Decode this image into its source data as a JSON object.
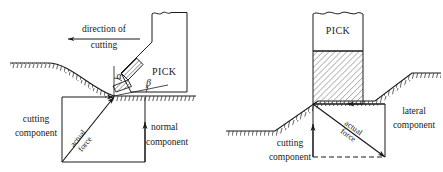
{
  "figure": {
    "stroke_color": "#1a1a1a",
    "background_color": "#ffffff",
    "hatch_color": "#6a6a6a"
  },
  "left_diagram": {
    "name": "side-view-cutting-forces",
    "direction_label_line1": "direction of",
    "direction_label_line2": "cutting",
    "pick_label": "PICK",
    "angle_alpha": "α",
    "angle_beta": "β",
    "cutting_component_line1": "cutting",
    "cutting_component_line2": "component",
    "normal_component_line1": "normal",
    "normal_component_line2": "component",
    "actual_force_line1": "actual",
    "actual_force_line2": "force"
  },
  "right_diagram": {
    "name": "front-view-cutting-forces",
    "pick_label": "PICK",
    "cutting_component_line1": "cutting",
    "cutting_component_line2": "component",
    "lateral_component_line1": "lateral",
    "lateral_component_line2": "component",
    "actual_force_line1": "actual",
    "actual_force_line2": "force"
  }
}
